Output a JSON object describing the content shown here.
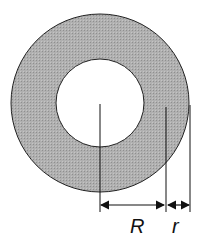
{
  "diagram": {
    "title": "",
    "outer_circle": {
      "cx": 100,
      "cy": 103,
      "r": 89,
      "fill": "#a9a9a9",
      "stroke": "#222222"
    },
    "inner_circle": {
      "cx": 100,
      "cy": 103,
      "r": 44,
      "fill": "#ffffff",
      "stroke": "#222222"
    },
    "labels": {
      "big_radius": "R",
      "small_radius": "r"
    },
    "dimension_lines": [
      {
        "name": "R",
        "from_x": 100,
        "to_x": 166,
        "y": 205
      },
      {
        "name": "r",
        "from_x": 166,
        "to_x": 190,
        "y": 205
      }
    ]
  }
}
